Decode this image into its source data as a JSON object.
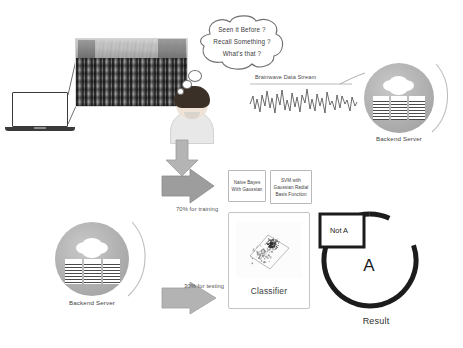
{
  "figure": {
    "bubble_lines": [
      "Seen it Before ?",
      "Recall Something ?",
      "What's that ?"
    ],
    "eeg_label": "Brainwave Data Stream",
    "server_top_label": "Backend Server",
    "server_bottom_label": "Backend Server",
    "arrow_train_label": "70% for training",
    "arrow_test_label": "30% for testing",
    "algo_naive_bayes": "Naive Bayes With Gaussian",
    "algo_svm": "SVM with Gaussian Radial Basis Function",
    "classifier_label": "Classifier",
    "result_label": "Result",
    "result_positive": "A",
    "result_negative": "Not A"
  },
  "colors": {
    "ink": "#1c1c1c",
    "line": "#6f6f6f",
    "arrow_fill": "#9a9a9a",
    "arrow_stroke": "#7d7d7d",
    "server_disc": "#ababab",
    "box_border": "#b8b8b8",
    "muted_text": "#555555",
    "background": "#ffffff"
  },
  "chart_data": {
    "type": "scatter",
    "xlabel": "",
    "ylabel": "",
    "legend": [],
    "clusters": [
      {
        "name": "class-a",
        "cx": 0.55,
        "cy": 0.4,
        "n": 120,
        "spread": 0.12,
        "color": "#2d2d2d"
      },
      {
        "name": "class-not-a",
        "cx": 0.4,
        "cy": 0.58,
        "n": 90,
        "spread": 0.2,
        "color": "#8a8a8a"
      }
    ],
    "boundary": "rotated-square"
  }
}
